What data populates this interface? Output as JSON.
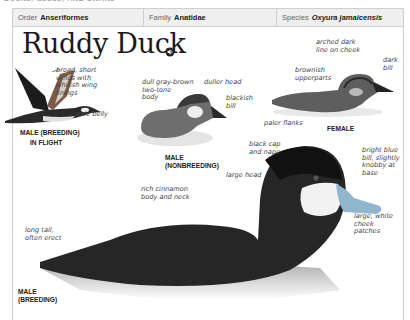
{
  "running_head": "Ducks, Geese, and Swans",
  "taxonomy": {
    "order_label": "Order",
    "order_value": "Anseriformes",
    "family_label": "Family",
    "family_value": "Anatidae",
    "species_label": "Species",
    "species_value": "Oxyura jamaicensis"
  },
  "title": "Ruddy Duck",
  "audio_icon": "speaker-icon",
  "figures": {
    "flight": {
      "caption_line1": "Male (Breeding)",
      "caption_line2": "In Flight",
      "labels": {
        "wings": "broad, short\nwings with\nwhitish wing\nlinings",
        "belly": "pale belly"
      }
    },
    "nonbreeding": {
      "caption": "Male\n(Nonbreeding)",
      "labels": {
        "body": "dull gray-brown\ntwo-tone\nbody",
        "head": "duller head",
        "bill": "blackish\nbill"
      }
    },
    "female": {
      "caption": "Female",
      "labels": {
        "cheek": "arched dark\nline on cheek",
        "bill": "dark\nbill",
        "upperparts": "brownish\nupperparts",
        "flanks": "paler flanks"
      }
    },
    "breeding": {
      "caption": "Male\n(Breeding)",
      "labels": {
        "cap": "black cap\nand nape",
        "bill": "bright blue\nbill, slightly\nknobby at\nbase",
        "head": "large head",
        "body": "rich cinnamon\nbody and neck",
        "cheek": "large, white\ncheek\npatches",
        "tail": "long tail,\noften erect"
      }
    }
  },
  "colors": {
    "taxon_bar_bg": "#efefef",
    "border": "#cfcfcf",
    "bill_blue": "#8fb6cc"
  }
}
